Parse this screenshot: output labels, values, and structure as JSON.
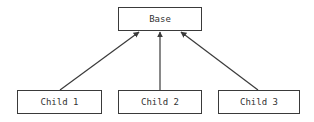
{
  "diagram": {
    "nodes": [
      {
        "id": "base",
        "label": "Base"
      },
      {
        "id": "child1",
        "label": "Child 1"
      },
      {
        "id": "child2",
        "label": "Child 2"
      },
      {
        "id": "child3",
        "label": "Child 3"
      }
    ],
    "edges": [
      {
        "from": "child1",
        "to": "base"
      },
      {
        "from": "child2",
        "to": "base"
      },
      {
        "from": "child3",
        "to": "base"
      }
    ],
    "colors": {
      "stroke": "#3a3a3a",
      "text": "#333333",
      "background": "#ffffff"
    }
  }
}
